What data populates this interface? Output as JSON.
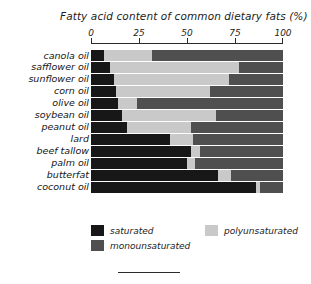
{
  "chart_data": {
    "type": "bar",
    "orientation": "horizontal",
    "stacked": true,
    "title": "Fatty acid content of common dietary fats (%)",
    "xlabel": "",
    "ylabel": "",
    "xlim": [
      0,
      100
    ],
    "grid": false,
    "legend_position": "bottom-left",
    "tick_labels": [
      "0",
      "25",
      "50",
      "75",
      "100"
    ],
    "ticks": [
      0,
      25,
      50,
      75,
      100
    ],
    "categories": [
      "canola oil",
      "safflower oil",
      "sunflower oil",
      "corn oil",
      "olive oil",
      "soybean oil",
      "peanut oil",
      "lard",
      "beef tallow",
      "palm oil",
      "butterfat",
      "coconut oil"
    ],
    "series": [
      {
        "name": "saturated",
        "color": "#171717",
        "values": [
          7,
          10,
          12,
          13,
          14,
          16,
          19,
          41,
          52,
          50,
          66,
          86
        ]
      },
      {
        "name": "polyunsaturated",
        "color": "#c9c9c9",
        "values": [
          25,
          67,
          60,
          49,
          10,
          49,
          33,
          12,
          5,
          4,
          7,
          2
        ]
      },
      {
        "name": "monounsaturated",
        "color": "#4f4f4f",
        "values": [
          68,
          23,
          28,
          38,
          76,
          35,
          48,
          47,
          43,
          46,
          27,
          12
        ]
      }
    ]
  },
  "legend": {
    "items": [
      {
        "label": "saturated",
        "color": "#171717"
      },
      {
        "label": "polyunsaturated",
        "color": "#c9c9c9"
      },
      {
        "label": "monounsaturated",
        "color": "#4f4f4f"
      }
    ]
  }
}
